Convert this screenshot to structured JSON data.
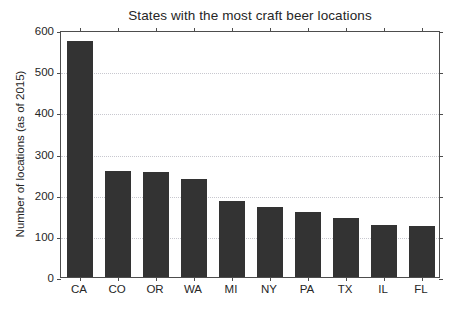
{
  "chart_data": {
    "type": "bar",
    "title": "States with the most craft beer locations",
    "xlabel": "",
    "ylabel": "Number of locations (as of 2015)",
    "categories": [
      "CA",
      "CO",
      "OR",
      "WA",
      "MI",
      "NY",
      "PA",
      "TX",
      "IL",
      "FL"
    ],
    "values": [
      573,
      257,
      256,
      238,
      184,
      170,
      157,
      143,
      127,
      123
    ],
    "ylim": [
      0,
      600
    ],
    "yticks": [
      0,
      100,
      200,
      300,
      400,
      500,
      600
    ],
    "ytick_labels": [
      "0",
      "100",
      "200",
      "300",
      "400",
      "500",
      "600"
    ],
    "grid": true,
    "grid_axis": "y",
    "legend": false,
    "bar_color": "#333333",
    "grid_color": "#c8c8cf",
    "axis_color": "#4d4d4d",
    "background_color": "#ffffff"
  }
}
